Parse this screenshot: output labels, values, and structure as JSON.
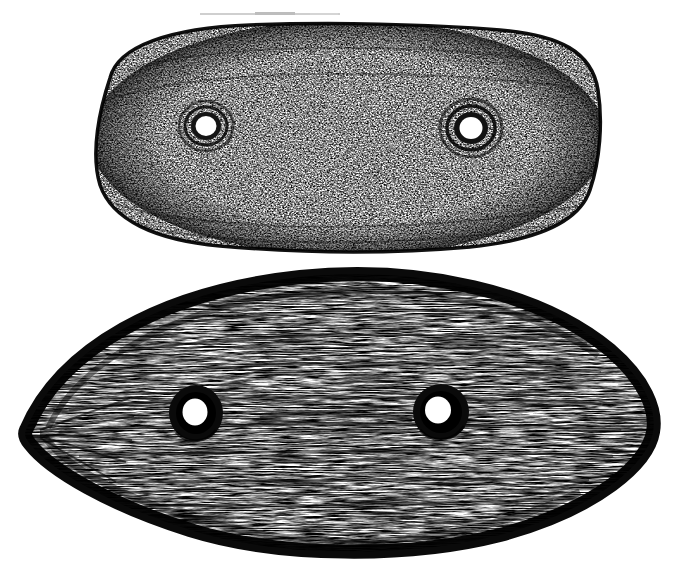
{
  "document": {
    "kind": "scanned-line-engraving",
    "title": "Two perforated oblong stone artifacts",
    "background_color": "#ffffff",
    "ink_color": "#111111",
    "width": 677,
    "height": 574
  },
  "figure": {
    "objects": [
      {
        "id": "upper-artifact",
        "label": "Upper perforated stone, rounded-rectangular outline",
        "shape": "rounded-oblong",
        "texture": "dense mottled stipple",
        "bounds": {
          "x": 85,
          "y": 25,
          "width": 515,
          "height": 228
        },
        "center": {
          "x": 342,
          "y": 139
        },
        "perforations": [
          {
            "id": "upper-left-hole",
            "label": "Left perforation",
            "cx": 206,
            "cy": 126,
            "r": 11
          },
          {
            "id": "upper-right-hole",
            "label": "Right perforation",
            "cx": 471,
            "cy": 128,
            "r": 12
          }
        ]
      },
      {
        "id": "lower-artifact",
        "label": "Lower perforated stone, pointed-oval (lenticular) outline",
        "shape": "lenticular-oval",
        "texture": "horizontal hatching with heavy outline",
        "bounds": {
          "x": 25,
          "y": 274,
          "width": 630,
          "height": 282
        },
        "center": {
          "x": 340,
          "y": 415
        },
        "perforations": [
          {
            "id": "lower-left-hole",
            "label": "Left perforation",
            "cx": 196,
            "cy": 413,
            "r": 13
          },
          {
            "id": "lower-right-hole",
            "label": "Right perforation",
            "cx": 441,
            "cy": 412,
            "r": 13
          }
        ]
      }
    ],
    "artifacts": [
      {
        "id": "scan-streak-top",
        "label": "Faint scan streak along top edge",
        "x": 200,
        "y": 14,
        "width": 140,
        "height": 2
      }
    ]
  }
}
